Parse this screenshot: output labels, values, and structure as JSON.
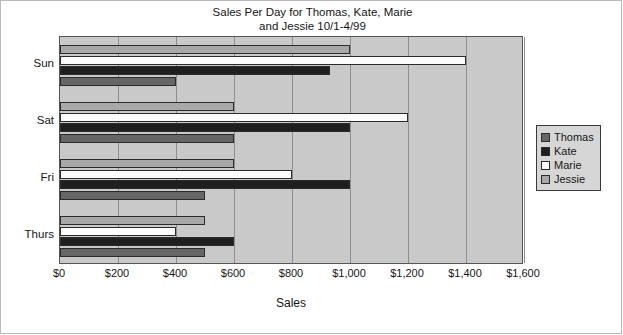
{
  "chart_data": {
    "type": "bar",
    "orientation": "horizontal",
    "title": "Sales Per Day for Thomas, Kate, Marie\nand Jessie 10/1-4/99",
    "xlabel": "Sales",
    "ylabel": "",
    "categories": [
      "Thurs",
      "Fri",
      "Sat",
      "Sun"
    ],
    "series": [
      {
        "name": "Thomas",
        "color": "#666666",
        "values": [
          500,
          500,
          600,
          400
        ]
      },
      {
        "name": "Kate",
        "color": "#1f1f1f",
        "values": [
          600,
          1000,
          1000,
          930
        ]
      },
      {
        "name": "Marie",
        "color": "#fbfbfb",
        "values": [
          400,
          800,
          1200,
          1400
        ]
      },
      {
        "name": "Jessie",
        "color": "#a8a8a8",
        "values": [
          500,
          600,
          600,
          1000
        ]
      }
    ],
    "xlim": [
      0,
      1600
    ],
    "xticks": [
      0,
      200,
      400,
      600,
      800,
      1000,
      1200,
      1400,
      1600
    ],
    "xticklabels": [
      "$0",
      "$200",
      "$400",
      "$600",
      "$800",
      "$1,000",
      "$1,200",
      "$1,400",
      "$1,600"
    ],
    "grid": true,
    "grid_axis": "x",
    "legend_position": "right",
    "plot_background": "#c9c9c9"
  },
  "legend": {
    "entries": [
      {
        "label": "Thomas"
      },
      {
        "label": "Kate"
      },
      {
        "label": "Marie"
      },
      {
        "label": "Jessie"
      }
    ]
  }
}
